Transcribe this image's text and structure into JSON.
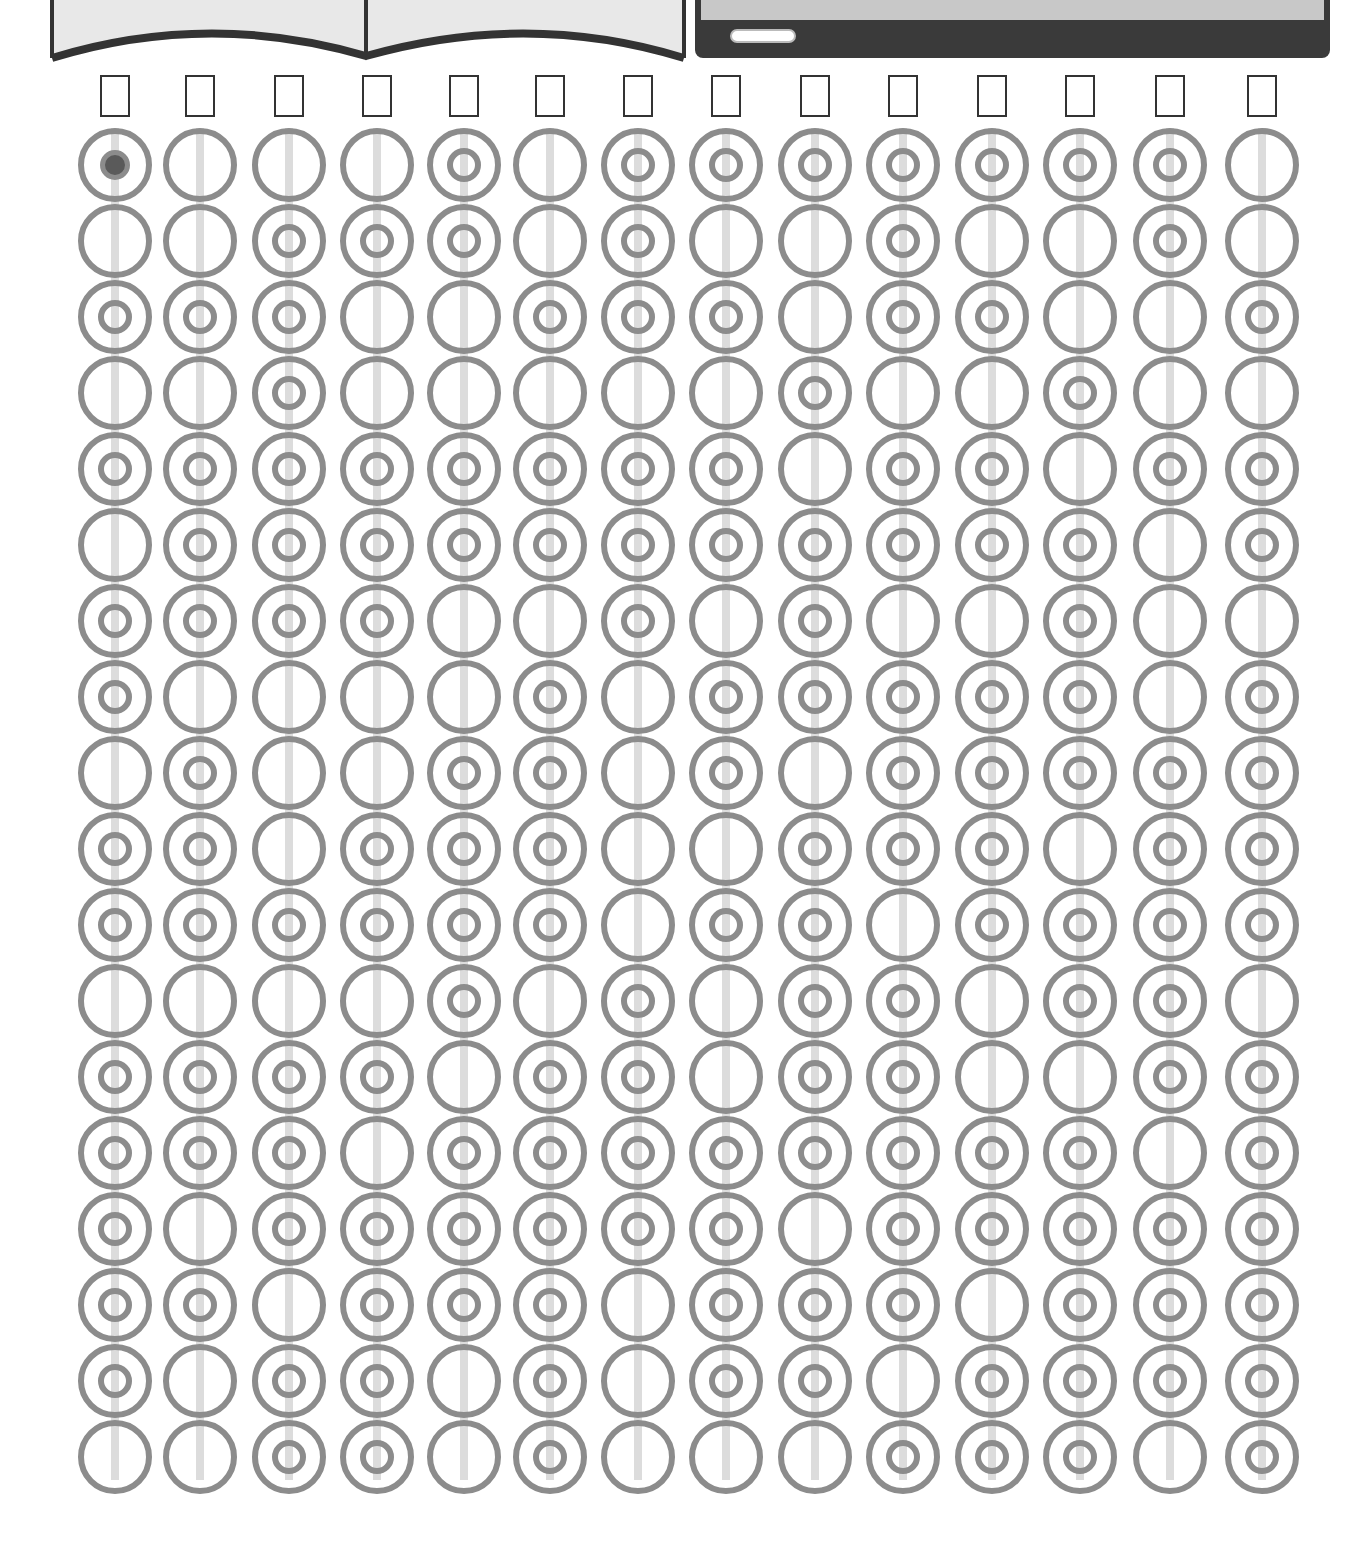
{
  "header": {
    "left_image": "open-book",
    "right_image": "tablet"
  },
  "colors": {
    "ring": "#8c8c8c",
    "rod": "#dcdcdc",
    "box_border": "#333333",
    "marker": "#5a5a5a"
  },
  "grid": {
    "columns": 14,
    "rows": 18,
    "col_x": [
      115,
      200,
      289,
      377,
      464,
      550,
      638,
      726,
      815,
      903,
      992,
      1080,
      1170,
      1262
    ],
    "answer_boxes": [
      "",
      "",
      "",
      "",
      "",
      "",
      "",
      "",
      "",
      "",
      "",
      "",
      "",
      ""
    ],
    "marker": {
      "col": 0,
      "row": 0
    },
    "patterns": [
      [
        2,
        0,
        1,
        0,
        1,
        0,
        1,
        1,
        0,
        1,
        1,
        0,
        1,
        1,
        1,
        1,
        1,
        0
      ],
      [
        0,
        0,
        1,
        0,
        1,
        1,
        1,
        0,
        1,
        1,
        1,
        0,
        1,
        1,
        0,
        1,
        0,
        0
      ],
      [
        0,
        1,
        1,
        1,
        1,
        1,
        1,
        0,
        0,
        0,
        1,
        0,
        1,
        1,
        1,
        0,
        1,
        1
      ],
      [
        0,
        1,
        0,
        0,
        1,
        1,
        1,
        0,
        0,
        1,
        1,
        0,
        1,
        0,
        1,
        1,
        1,
        1
      ],
      [
        1,
        1,
        0,
        0,
        1,
        1,
        0,
        0,
        1,
        1,
        1,
        1,
        0,
        1,
        1,
        1,
        0,
        0
      ],
      [
        0,
        0,
        1,
        0,
        1,
        1,
        0,
        1,
        1,
        1,
        1,
        0,
        1,
        1,
        1,
        1,
        1,
        1
      ],
      [
        1,
        1,
        1,
        0,
        1,
        1,
        1,
        0,
        0,
        0,
        0,
        1,
        1,
        1,
        1,
        0,
        0,
        0
      ],
      [
        1,
        0,
        1,
        0,
        1,
        1,
        0,
        1,
        1,
        0,
        1,
        0,
        0,
        1,
        1,
        1,
        1,
        0
      ],
      [
        1,
        0,
        0,
        1,
        0,
        1,
        1,
        1,
        0,
        1,
        1,
        1,
        1,
        1,
        0,
        1,
        1,
        0
      ],
      [
        1,
        1,
        1,
        0,
        1,
        1,
        0,
        1,
        1,
        1,
        0,
        1,
        1,
        1,
        1,
        1,
        0,
        1
      ],
      [
        1,
        0,
        1,
        0,
        1,
        1,
        0,
        1,
        1,
        1,
        1,
        0,
        0,
        1,
        1,
        0,
        1,
        1
      ],
      [
        1,
        0,
        0,
        1,
        0,
        1,
        1,
        1,
        1,
        0,
        1,
        1,
        0,
        1,
        1,
        1,
        1,
        1
      ],
      [
        1,
        1,
        0,
        0,
        1,
        0,
        0,
        0,
        1,
        1,
        1,
        1,
        1,
        0,
        1,
        1,
        1,
        0
      ],
      [
        0,
        0,
        1,
        0,
        1,
        1,
        0,
        1,
        1,
        1,
        1,
        0,
        1,
        1,
        1,
        1,
        1,
        1
      ]
    ]
  }
}
